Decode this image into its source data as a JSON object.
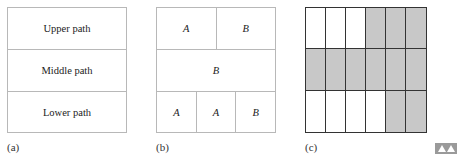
{
  "panels": {
    "a": {
      "label": "(a)",
      "rows": [
        {
          "cells": [
            "Upper path"
          ]
        },
        {
          "cells": [
            "Middle path"
          ]
        },
        {
          "cells": [
            "Lower path"
          ]
        }
      ]
    },
    "b": {
      "label": "(b)",
      "rows": [
        {
          "cells": [
            "A",
            "B"
          ]
        },
        {
          "cells": [
            "B"
          ]
        },
        {
          "cells": [
            "A",
            "A",
            "B"
          ]
        }
      ]
    },
    "c": {
      "label": "(c)",
      "grid": {
        "columns": 6,
        "rows": 3,
        "shaded": [
          [
            0,
            0,
            0,
            1,
            1,
            1
          ],
          [
            1,
            1,
            1,
            1,
            1,
            1
          ],
          [
            0,
            0,
            0,
            0,
            1,
            1
          ]
        ],
        "shade_color": "#c8c8c8"
      }
    }
  },
  "corner_icon": "navigation-arrows-icon"
}
